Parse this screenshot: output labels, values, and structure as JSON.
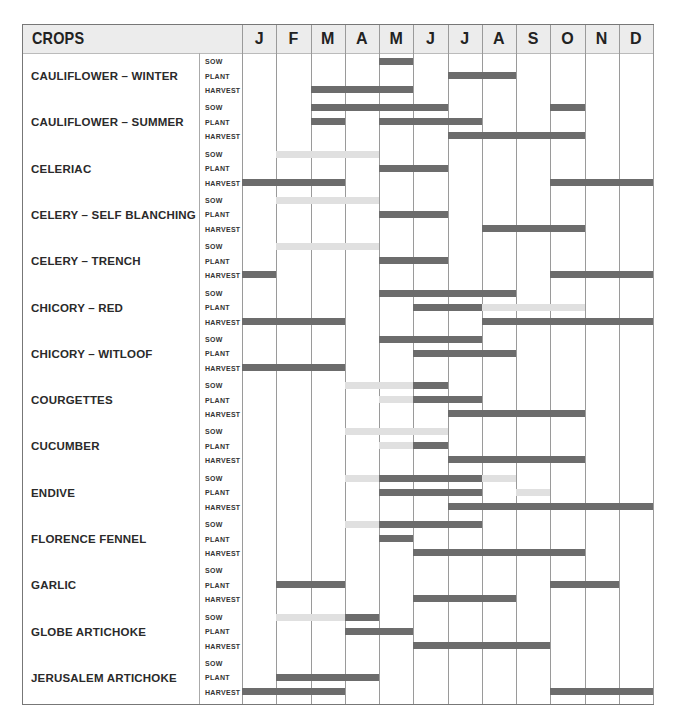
{
  "header": {
    "title": "CROPS",
    "months": [
      "J",
      "F",
      "M",
      "A",
      "M",
      "J",
      "J",
      "A",
      "S",
      "O",
      "N",
      "D"
    ]
  },
  "stages": [
    "SOW",
    "PLANT",
    "HARVEST"
  ],
  "colors": {
    "dark_bar": "#6c6c6c",
    "light_bar": "#e0e0e0",
    "header_bg": "#ececec"
  },
  "chart_data": {
    "type": "gantt",
    "title": "CROPS",
    "xlabel": "Month",
    "x": [
      "J",
      "F",
      "M",
      "A",
      "M",
      "J",
      "J",
      "A",
      "S",
      "O",
      "N",
      "D"
    ],
    "legend_note": "dark bar = main period, light bar = optional/extended period (under cover)",
    "crops": [
      {
        "name": "CAULIFLOWER – WINTER",
        "sow": [
          [
            4,
            5,
            "dark"
          ]
        ],
        "plant": [
          [
            6,
            8,
            "dark"
          ]
        ],
        "harvest": [
          [
            2,
            5,
            "dark"
          ]
        ]
      },
      {
        "name": "CAULIFLOWER – SUMMER",
        "sow": [
          [
            2,
            6,
            "dark"
          ],
          [
            9,
            10,
            "dark"
          ]
        ],
        "plant": [
          [
            2,
            3,
            "dark"
          ],
          [
            4,
            7,
            "dark"
          ]
        ],
        "harvest": [
          [
            6,
            10,
            "dark"
          ]
        ]
      },
      {
        "name": "CELERIAC",
        "sow": [
          [
            1,
            4,
            "light"
          ]
        ],
        "plant": [
          [
            4,
            6,
            "dark"
          ]
        ],
        "harvest": [
          [
            0,
            3,
            "dark"
          ],
          [
            9,
            12,
            "dark"
          ]
        ]
      },
      {
        "name": "CELERY – SELF BLANCHING",
        "sow": [
          [
            1,
            4,
            "light"
          ]
        ],
        "plant": [
          [
            4,
            6,
            "dark"
          ]
        ],
        "harvest": [
          [
            7,
            10,
            "dark"
          ]
        ]
      },
      {
        "name": "CELERY – TRENCH",
        "sow": [
          [
            1,
            4,
            "light"
          ]
        ],
        "plant": [
          [
            4,
            6,
            "dark"
          ]
        ],
        "harvest": [
          [
            0,
            1,
            "dark"
          ],
          [
            9,
            12,
            "dark"
          ]
        ]
      },
      {
        "name": "CHICORY – RED",
        "sow": [
          [
            4,
            8,
            "dark"
          ]
        ],
        "plant": [
          [
            5,
            7,
            "dark"
          ],
          [
            7,
            10,
            "light"
          ]
        ],
        "harvest": [
          [
            0,
            3,
            "dark"
          ],
          [
            7,
            12,
            "dark"
          ]
        ]
      },
      {
        "name": "CHICORY – WITLOOF",
        "sow": [
          [
            4,
            7,
            "dark"
          ]
        ],
        "plant": [
          [
            5,
            8,
            "dark"
          ]
        ],
        "harvest": [
          [
            0,
            3,
            "dark"
          ]
        ]
      },
      {
        "name": "COURGETTES",
        "sow": [
          [
            3,
            5,
            "light"
          ],
          [
            5,
            6,
            "dark"
          ]
        ],
        "plant": [
          [
            4,
            5,
            "light"
          ],
          [
            5,
            7,
            "dark"
          ]
        ],
        "harvest": [
          [
            6,
            10,
            "dark"
          ]
        ]
      },
      {
        "name": "CUCUMBER",
        "sow": [
          [
            3,
            6,
            "light"
          ]
        ],
        "plant": [
          [
            4,
            5,
            "light"
          ],
          [
            5,
            6,
            "dark"
          ]
        ],
        "harvest": [
          [
            6,
            10,
            "dark"
          ]
        ]
      },
      {
        "name": "ENDIVE",
        "sow": [
          [
            3,
            4,
            "light"
          ],
          [
            4,
            7,
            "dark"
          ],
          [
            7,
            8,
            "light"
          ]
        ],
        "plant": [
          [
            4,
            7,
            "dark"
          ],
          [
            8,
            9,
            "light"
          ]
        ],
        "harvest": [
          [
            6,
            12,
            "dark"
          ]
        ]
      },
      {
        "name": "FLORENCE FENNEL",
        "sow": [
          [
            3,
            4,
            "light"
          ],
          [
            4,
            7,
            "dark"
          ]
        ],
        "plant": [
          [
            4,
            5,
            "dark"
          ]
        ],
        "harvest": [
          [
            5,
            10,
            "dark"
          ]
        ]
      },
      {
        "name": "GARLIC",
        "sow": [],
        "plant": [
          [
            1,
            3,
            "dark"
          ],
          [
            9,
            11,
            "dark"
          ]
        ],
        "harvest": [
          [
            5,
            8,
            "dark"
          ]
        ]
      },
      {
        "name": "GLOBE ARTICHOKE",
        "sow": [
          [
            1,
            3,
            "light"
          ],
          [
            3,
            4,
            "dark"
          ]
        ],
        "plant": [
          [
            3,
            5,
            "dark"
          ]
        ],
        "harvest": [
          [
            5,
            9,
            "dark"
          ]
        ]
      },
      {
        "name": "JERUSALEM ARTICHOKE",
        "sow": [],
        "plant": [
          [
            1,
            4,
            "dark"
          ]
        ],
        "harvest": [
          [
            0,
            3,
            "dark"
          ],
          [
            9,
            12,
            "dark"
          ]
        ]
      }
    ]
  }
}
